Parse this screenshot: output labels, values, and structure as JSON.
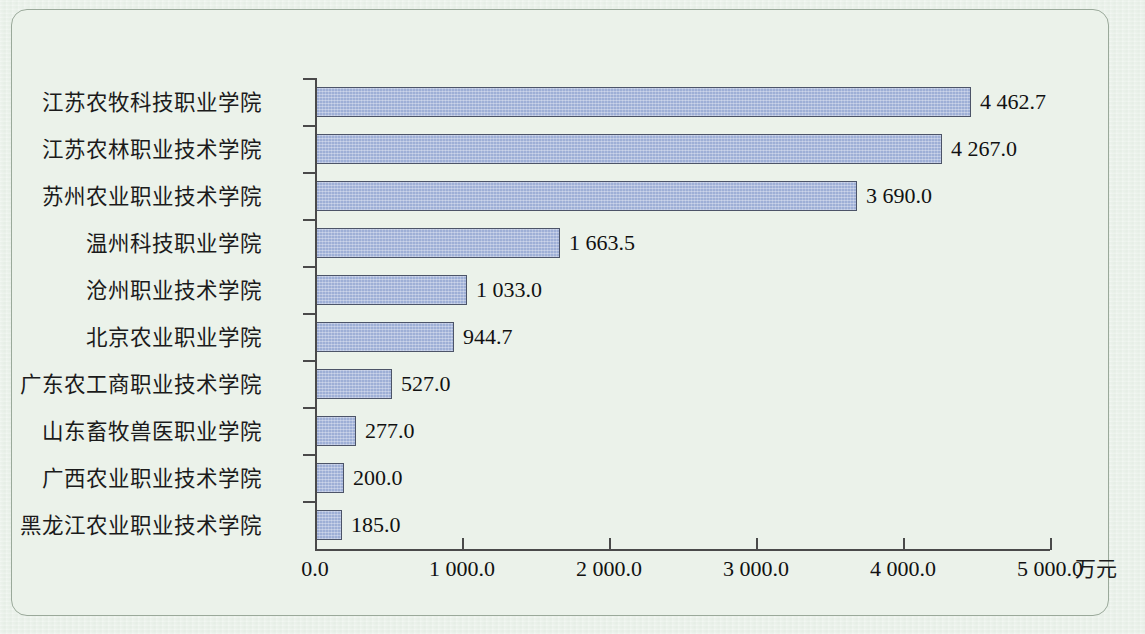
{
  "chart_data": {
    "type": "bar",
    "orientation": "horizontal",
    "title": "",
    "xlabel": "万元",
    "ylabel": "",
    "xlim": [
      0,
      5000
    ],
    "grid": false,
    "legend": null,
    "categories": [
      "江苏农牧科技职业学院",
      "江苏农林职业技术学院",
      "苏州农业职业技术学院",
      "温州科技职业学院",
      "沧州职业技术学院",
      "北京农业职业学院",
      "广东农工商职业技术学院",
      "山东畜牧兽医职业学院",
      "广西农业职业技术学院",
      "黑龙江农业职业技术学院"
    ],
    "values": [
      4462.7,
      4267.0,
      3690.0,
      1663.5,
      1033.0,
      944.7,
      527.0,
      277.0,
      200.0,
      185.0
    ],
    "value_labels": [
      "4 462.7",
      "4 267.0",
      "3 690.0",
      "1 663.5",
      "1 033.0",
      "944.7",
      "527.0",
      "277.0",
      "200.0",
      "185.0"
    ],
    "xticks": [
      0,
      1000,
      2000,
      3000,
      4000,
      5000
    ],
    "xtick_labels": [
      "0.0",
      "1 000.0",
      "2 000.0",
      "3 000.0",
      "4 000.0",
      "5 000.0"
    ],
    "colors": {
      "bar_fill": "#9eafd6",
      "bar_border": "#4c5468",
      "axis": "#4a4a4a",
      "background": "#ebf2ea",
      "frame_border": "#9aa99a",
      "text": "#111111"
    }
  }
}
